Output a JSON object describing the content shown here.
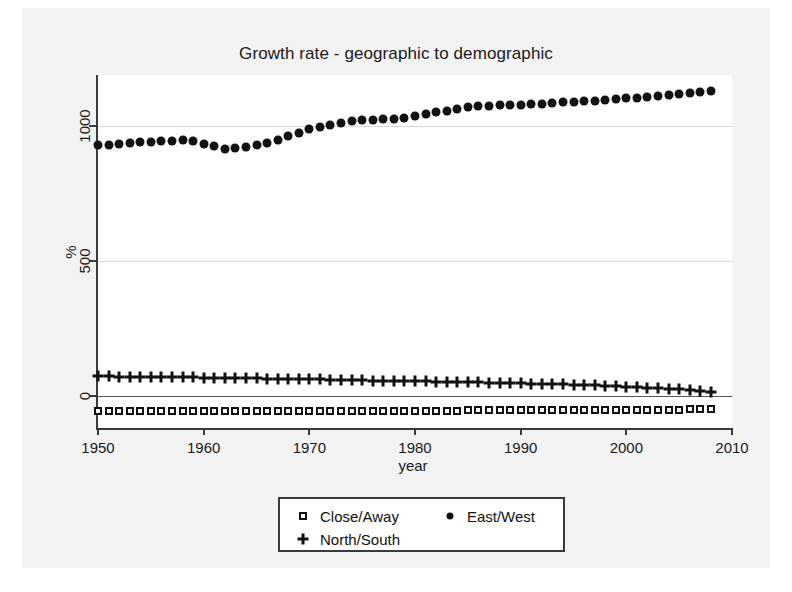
{
  "chart_data": {
    "type": "scatter",
    "title": "Growth rate - geographic to demographic",
    "xlabel": "year",
    "ylabel": "%",
    "xlim": [
      1950,
      2010
    ],
    "ylim": [
      -120,
      1190
    ],
    "xticks": [
      1950,
      1960,
      1970,
      1980,
      1990,
      2000,
      2010
    ],
    "xtick_labels": [
      "1950",
      "1960",
      "1970",
      "1980",
      "1990",
      "2000",
      "2010"
    ],
    "yticks": [
      0,
      500,
      1000
    ],
    "ytick_labels": [
      "0",
      "500",
      "1000"
    ],
    "grid": "horizontal",
    "legend_position": "below-center",
    "x": [
      1950,
      1951,
      1952,
      1953,
      1954,
      1955,
      1956,
      1957,
      1958,
      1959,
      1960,
      1961,
      1962,
      1963,
      1964,
      1965,
      1966,
      1967,
      1968,
      1969,
      1970,
      1971,
      1972,
      1973,
      1974,
      1975,
      1976,
      1977,
      1978,
      1979,
      1980,
      1981,
      1982,
      1983,
      1984,
      1985,
      1986,
      1987,
      1988,
      1989,
      1990,
      1991,
      1992,
      1993,
      1994,
      1995,
      1996,
      1997,
      1998,
      1999,
      2000,
      2001,
      2002,
      2003,
      2004,
      2005,
      2006,
      2007,
      2008
    ],
    "series": [
      {
        "name": "East/West",
        "marker": "filled-circle",
        "color": "#121212",
        "values": [
          932,
          930,
          934,
          938,
          940,
          942,
          944,
          946,
          948,
          944,
          934,
          925,
          916,
          918,
          922,
          930,
          938,
          948,
          962,
          975,
          988,
          998,
          1006,
          1012,
          1018,
          1022,
          1024,
          1026,
          1028,
          1032,
          1038,
          1046,
          1052,
          1058,
          1064,
          1070,
          1074,
          1076,
          1078,
          1080,
          1080,
          1082,
          1084,
          1086,
          1088,
          1090,
          1092,
          1094,
          1096,
          1100,
          1104,
          1106,
          1108,
          1112,
          1116,
          1120,
          1124,
          1128,
          1130
        ]
      },
      {
        "name": "North/South",
        "marker": "plus",
        "color": "#121212",
        "values": [
          72,
          72,
          71,
          71,
          70,
          70,
          69,
          69,
          68,
          68,
          67,
          66,
          66,
          65,
          65,
          64,
          63,
          62,
          62,
          61,
          60,
          60,
          59,
          58,
          58,
          57,
          56,
          56,
          55,
          54,
          54,
          53,
          52,
          52,
          51,
          50,
          49,
          48,
          48,
          47,
          46,
          45,
          44,
          43,
          42,
          41,
          40,
          39,
          37,
          36,
          34,
          32,
          30,
          28,
          26,
          24,
          21,
          18,
          15
        ]
      },
      {
        "name": "Close/Away",
        "marker": "open-square",
        "color": "#121212",
        "values": [
          -56,
          -56,
          -56,
          -56,
          -56,
          -56,
          -56,
          -56,
          -56,
          -56,
          -56,
          -56,
          -56,
          -56,
          -56,
          -56,
          -56,
          -56,
          -56,
          -56,
          -56,
          -56,
          -56,
          -56,
          -56,
          -56,
          -56,
          -56,
          -56,
          -56,
          -56,
          -56,
          -56,
          -56,
          -56,
          -55,
          -55,
          -55,
          -55,
          -55,
          -55,
          -55,
          -55,
          -55,
          -55,
          -54,
          -54,
          -54,
          -54,
          -54,
          -54,
          -53,
          -53,
          -53,
          -52,
          -52,
          -51,
          -50,
          -49
        ]
      }
    ]
  },
  "legend": {
    "entries": [
      {
        "label": "Close/Away",
        "marker": "open-square"
      },
      {
        "label": "East/West",
        "marker": "filled-circle"
      },
      {
        "label": "North/South",
        "marker": "plus"
      }
    ]
  }
}
